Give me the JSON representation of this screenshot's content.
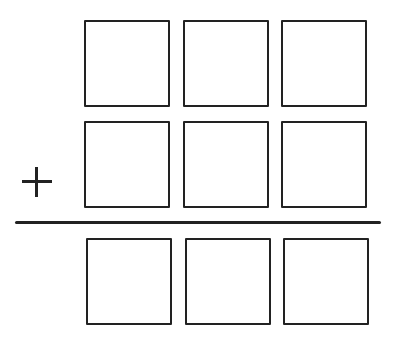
{
  "diagram": {
    "type": "column-addition-template",
    "operator": "+",
    "digits_per_row": 3,
    "rows": [
      {
        "role": "addend-1",
        "cells": [
          "",
          "",
          ""
        ]
      },
      {
        "role": "addend-2",
        "cells": [
          "",
          "",
          ""
        ]
      },
      {
        "role": "sum",
        "cells": [
          "",
          "",
          ""
        ]
      }
    ],
    "colors": {
      "stroke": "#222222",
      "background": "#ffffff"
    }
  }
}
